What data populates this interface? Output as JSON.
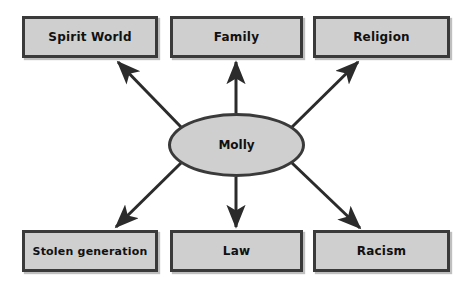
{
  "diagram": {
    "center": {
      "label": "Molly",
      "shape": "ellipse",
      "fill": "#cfcfcf",
      "stroke": "#3a3a3a"
    },
    "nodes": [
      {
        "id": "spirit-world",
        "label": "Spirit World",
        "row": "top",
        "col": 1
      },
      {
        "id": "family",
        "label": "Family",
        "row": "top",
        "col": 2
      },
      {
        "id": "religion",
        "label": "Religion",
        "row": "top",
        "col": 3
      },
      {
        "id": "stolen-generation",
        "label": "Stolen generation",
        "row": "bottom",
        "col": 1
      },
      {
        "id": "law",
        "label": "Law",
        "row": "bottom",
        "col": 2
      },
      {
        "id": "racism",
        "label": "Racism",
        "row": "bottom",
        "col": 3
      }
    ],
    "connections": [
      {
        "from": "Molly",
        "to": "Spirit World",
        "direction": "up-left"
      },
      {
        "from": "Molly",
        "to": "Family",
        "direction": "up"
      },
      {
        "from": "Molly",
        "to": "Religion",
        "direction": "up-right"
      },
      {
        "from": "Molly",
        "to": "Stolen generation",
        "direction": "down-left"
      },
      {
        "from": "Molly",
        "to": "Law",
        "direction": "down"
      },
      {
        "from": "Molly",
        "to": "Racism",
        "direction": "down-right"
      }
    ],
    "colors": {
      "node_fill": "#cfcfcf",
      "node_stroke": "#3a3a3a",
      "arrow": "#2b2b2b",
      "background": "#ffffff",
      "text": "#111111"
    }
  }
}
